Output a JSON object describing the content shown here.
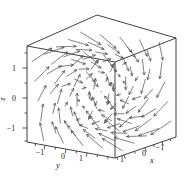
{
  "figure": {
    "width": 186,
    "height": 178,
    "colors": {
      "background": "#ffffff",
      "cube": "#2b2b2b",
      "tick": "#2b2b2b",
      "arrow": "#4a4a4a",
      "label": "#1c1c1c"
    }
  },
  "chart_data": {
    "type": "quiver3d",
    "title": "",
    "field": {
      "fx": "y",
      "fy": "z",
      "fz": "x"
    },
    "axes": {
      "x": {
        "label": "x",
        "tick_values": [
          1,
          0,
          -1
        ]
      },
      "y": {
        "label": "y",
        "tick_values": [
          -1,
          0,
          1
        ]
      },
      "z": {
        "label": "z",
        "tick_values": [
          1,
          0,
          -1
        ]
      }
    },
    "domain": {
      "x": [
        -1.6,
        1.6
      ],
      "y": [
        -1.6,
        1.6
      ],
      "z": [
        -1.6,
        1.6
      ]
    },
    "grid": {
      "min": -1.28,
      "max": 1.28,
      "steps": 5
    },
    "projection": {
      "origin": [
        101.4,
        91.4
      ],
      "ex": [
        -19,
        6.5
      ],
      "ey": [
        27.5,
        5
      ],
      "ez": [
        0,
        -30
      ]
    },
    "arrow_scale": 0.33,
    "cube_edges": [
      [
        27,
        142,
        115,
        158
      ],
      [
        115,
        158,
        176,
        137
      ],
      [
        27,
        142,
        27,
        46
      ],
      [
        115,
        158,
        115,
        62
      ],
      [
        176,
        137,
        176,
        38
      ],
      [
        27,
        46,
        115,
        62
      ],
      [
        115,
        62,
        176,
        38
      ],
      [
        27,
        46,
        97,
        15
      ],
      [
        97,
        15,
        176,
        38
      ]
    ],
    "ticks": {
      "major": [
        [
          27,
          68,
          22.5,
          68
        ],
        [
          27,
          98,
          22.5,
          98
        ],
        [
          27,
          128,
          22.5,
          128
        ],
        [
          45,
          145.3,
          44.3,
          149.2
        ],
        [
          66,
          149.1,
          65.3,
          153.0
        ],
        [
          87,
          152.9,
          86.3,
          156.8
        ],
        [
          124,
          154.9,
          125.3,
          158.7
        ],
        [
          145,
          147.7,
          146.3,
          151.5
        ],
        [
          162,
          141.8,
          163.3,
          145.6
        ]
      ],
      "minor": [
        [
          27,
          53,
          24.5,
          53
        ],
        [
          27,
          83,
          24.5,
          83
        ],
        [
          27,
          113,
          24.5,
          113
        ],
        [
          27,
          141,
          24.5,
          141
        ],
        [
          35.6,
          143.6,
          35.2,
          146.0
        ],
        [
          55.5,
          147.2,
          55.1,
          149.6
        ],
        [
          76.5,
          151.0,
          76.1,
          153.4
        ],
        [
          97.5,
          154.8,
          97.1,
          157.2
        ],
        [
          108,
          156.7,
          107.6,
          159.1
        ],
        [
          117,
          157.3,
          117.8,
          159.7
        ],
        [
          134.5,
          151.3,
          135.3,
          153.7
        ],
        [
          153.5,
          144.7,
          154.3,
          147.1
        ],
        [
          170,
          139.0,
          170.8,
          141.4
        ]
      ]
    },
    "labels": [
      {
        "name": "z-tick-1",
        "text": "1",
        "x": 14,
        "y": 70.5,
        "italic": false,
        "rotate": 0
      },
      {
        "name": "z-tick-0",
        "text": "0",
        "x": 14,
        "y": 100.5,
        "italic": false,
        "rotate": 0
      },
      {
        "name": "z-tick-m1",
        "text": "−1",
        "x": 11,
        "y": 130.5,
        "italic": false,
        "rotate": 0
      },
      {
        "name": "z-axis",
        "text": "z",
        "x": 5,
        "y": 99,
        "italic": true,
        "rotate": -90
      },
      {
        "name": "y-tick-m1",
        "text": "−1",
        "x": 40,
        "y": 154.5,
        "italic": false,
        "rotate": 0
      },
      {
        "name": "y-tick-0",
        "text": "0",
        "x": 63,
        "y": 158.5,
        "italic": false,
        "rotate": 0
      },
      {
        "name": "y-tick-1",
        "text": "1",
        "x": 81,
        "y": 161,
        "italic": false,
        "rotate": 0
      },
      {
        "name": "y-axis",
        "text": "y",
        "x": 58,
        "y": 168,
        "italic": true,
        "rotate": 0
      },
      {
        "name": "x-tick-1",
        "text": "1",
        "x": 122,
        "y": 161.5,
        "italic": false,
        "rotate": 0
      },
      {
        "name": "x-tick-0",
        "text": "0",
        "x": 144,
        "y": 155.5,
        "italic": false,
        "rotate": 0
      },
      {
        "name": "x-tick-m1",
        "text": "−1",
        "x": 160,
        "y": 149.5,
        "italic": false,
        "rotate": 0
      },
      {
        "name": "x-axis",
        "text": "x",
        "x": 152,
        "y": 163,
        "italic": true,
        "rotate": 0
      }
    ]
  }
}
